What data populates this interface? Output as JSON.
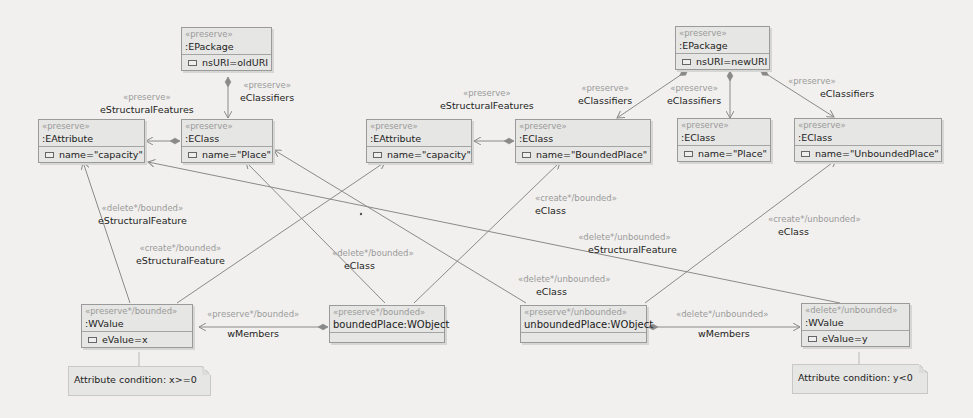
{
  "nodes": {
    "epkg_old": {
      "stereotype": "«preserve»",
      "type": ":EPackage",
      "attr": "nsURI=oldURI"
    },
    "eattr_old": {
      "stereotype": "«preserve»",
      "type": ":EAttribute",
      "attr": "name=\"capacity\""
    },
    "eclass_place_old": {
      "stereotype": "«preserve»",
      "type": ":EClass",
      "attr": "name=\"Place\""
    },
    "eattr_new": {
      "stereotype": "«preserve»",
      "type": ":EAttribute",
      "attr": "name=\"capacity\""
    },
    "eclass_bounded": {
      "stereotype": "«preserve»",
      "type": ":EClass",
      "attr": "name=\"BoundedPlace\""
    },
    "epkg_new": {
      "stereotype": "«preserve»",
      "type": ":EPackage",
      "attr": "nsURI=newURI"
    },
    "eclass_place_new": {
      "stereotype": "«preserve»",
      "type": ":EClass",
      "attr": "name=\"Place\""
    },
    "eclass_unbounded": {
      "stereotype": "«preserve»",
      "type": ":EClass",
      "attr": "name=\"UnboundedPlace\""
    },
    "wvalue_x": {
      "stereotype": "«preserve*/bounded»",
      "type": ":WValue",
      "attr": "eValue=x"
    },
    "bounded_obj": {
      "stereotype": "«preserve*/bounded»",
      "type": "boundedPlace:WObject"
    },
    "unbounded_obj": {
      "stereotype": "«preserve*/unbounded»",
      "type": "unboundedPlace:WObject"
    },
    "wvalue_y": {
      "stereotype": "«delete*/unbounded»",
      "type": ":WValue",
      "attr": "eValue=y"
    }
  },
  "edge_labels": {
    "old_sf": {
      "stereotype": "«preserve»",
      "name": "eStructuralFeatures"
    },
    "old_ec": {
      "stereotype": "«preserve»",
      "name": "eClassifiers"
    },
    "new_sf": {
      "stereotype": "«preserve»",
      "name": "eStructuralFeatures"
    },
    "new_ec1": {
      "stereotype": "«preserve»",
      "name": "eClassifiers"
    },
    "new_ec2": {
      "stereotype": "«preserve»",
      "name": "eClassifiers"
    },
    "new_ec3": {
      "stereotype": "«preserve»",
      "name": "eClassifiers"
    },
    "del_b_sf": {
      "stereotype": "«delete*/bounded»",
      "name": "eStructuralFeature"
    },
    "cre_b_sf": {
      "stereotype": "«create*/bounded»",
      "name": "eStructuralFeature"
    },
    "del_b_ec": {
      "stereotype": "«delete*/bounded»",
      "name": "eClass"
    },
    "cre_b_ec": {
      "stereotype": "«create*/bounded»",
      "name": "eClass"
    },
    "del_u_sf": {
      "stereotype": "«delete*/unbounded»",
      "name": "eStructuralFeature"
    },
    "del_u_ec": {
      "stereotype": "«delete*/unbounded»",
      "name": "eClass"
    },
    "cre_u_ec": {
      "stereotype": "«create*/unbounded»",
      "name": "eClass"
    },
    "b_wm": {
      "stereotype": "«preserve*/bounded»",
      "name": "wMembers"
    },
    "u_wm": {
      "stereotype": "«delete*/unbounded»",
      "name": "wMembers"
    }
  },
  "notes": {
    "cond_x": "Attribute condition: x>=0",
    "cond_y": "Attribute condition: y<0"
  },
  "colors": {
    "background": "#f1f0ee",
    "node_fill": "#e6e6e4",
    "edge": "#8a8a8a",
    "stereotype_text": "#9a9a9a"
  }
}
